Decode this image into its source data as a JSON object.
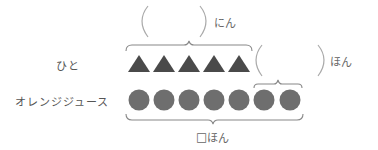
{
  "rows": {
    "people": {
      "label": "ひと",
      "shape": "triangle",
      "count": 5,
      "color": "#4a4a4a"
    },
    "juice": {
      "label": "オレンジジュース",
      "shape": "circle",
      "count": 7,
      "color": "#6e6e6e"
    }
  },
  "annotations": {
    "people_count": {
      "blank": "(      )",
      "unit": "にん"
    },
    "extra_count": {
      "blank": "(      )",
      "unit": "ほん"
    },
    "total_juice": {
      "box": "□",
      "unit": "ほん"
    }
  },
  "colors": {
    "brace": "#888888",
    "paren": "#aaaaaa",
    "text": "#555555"
  }
}
